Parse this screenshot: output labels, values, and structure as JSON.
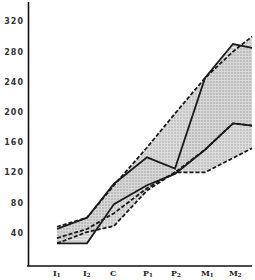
{
  "chart_data": {
    "type": "area",
    "title": "",
    "xlabel": "",
    "ylabel": "",
    "categories": [
      "I1",
      "I2",
      "C",
      "P1",
      "P2",
      "M1",
      "M2"
    ],
    "category_labels": [
      {
        "main": "I",
        "sub": "1"
      },
      {
        "main": "I",
        "sub": "2"
      },
      {
        "main": "C",
        "sub": ""
      },
      {
        "main": "P",
        "sub": "1"
      },
      {
        "main": "P",
        "sub": "2"
      },
      {
        "main": "M",
        "sub": "1"
      },
      {
        "main": "M",
        "sub": "2"
      }
    ],
    "yticks": [
      40,
      80,
      120,
      160,
      200,
      240,
      280,
      320
    ],
    "ylim": [
      0,
      330
    ],
    "grid": false,
    "legend": "none",
    "series": [
      {
        "name": "upper-solid",
        "style": "solid",
        "values": [
          45,
          60,
          105,
          140,
          125,
          245,
          290
        ],
        "end_value": 285
      },
      {
        "name": "upper-dashed",
        "style": "dashed",
        "values": [
          48,
          60,
          103,
          153,
          198,
          245,
          280
        ],
        "end_value": 300
      },
      {
        "name": "lower-solid",
        "style": "solid",
        "values": [
          26,
          26,
          78,
          103,
          118,
          150,
          185
        ],
        "end_value": 182
      },
      {
        "name": "lower-dashed",
        "style": "dashed",
        "values": [
          26,
          41,
          49,
          96,
          120,
          120,
          139
        ],
        "end_value": 152
      },
      {
        "name": "middle-dashed",
        "style": "dashed",
        "values": [
          33,
          45,
          66,
          99,
          120,
          150,
          185
        ],
        "end_value": 182
      }
    ],
    "bands": [
      {
        "name": "upper-band",
        "between": [
          "upper-solid",
          "lower-solid"
        ],
        "fill": "hatched-gray"
      },
      {
        "name": "lower-band",
        "between": [
          "upper-dashed",
          "lower-dashed"
        ],
        "fill": "stipple-gray"
      }
    ]
  }
}
